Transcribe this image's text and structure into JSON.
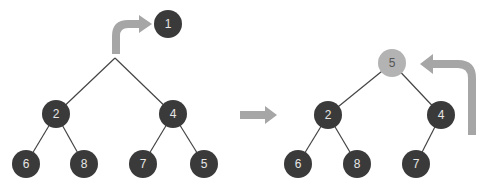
{
  "colors": {
    "node_dark": "#3a3a3a",
    "node_highlight": "#b3b3b3",
    "edge": "#444444",
    "arrow": "#a6a6a6"
  },
  "left_tree": {
    "removed_node": {
      "label": "1",
      "x": 168,
      "y": 24
    },
    "root_point": {
      "x": 115,
      "y": 58
    },
    "nodes": [
      {
        "id": "n2",
        "label": "2",
        "x": 56,
        "y": 114
      },
      {
        "id": "n4",
        "label": "4",
        "x": 173,
        "y": 114
      },
      {
        "id": "n6",
        "label": "6",
        "x": 26,
        "y": 164
      },
      {
        "id": "n8",
        "label": "8",
        "x": 84,
        "y": 164
      },
      {
        "id": "n7",
        "label": "7",
        "x": 143,
        "y": 164
      },
      {
        "id": "n5",
        "label": "5",
        "x": 204,
        "y": 164
      }
    ]
  },
  "right_tree": {
    "nodes": [
      {
        "id": "r5",
        "label": "5",
        "x": 392,
        "y": 63,
        "highlight": true
      },
      {
        "id": "r2",
        "label": "2",
        "x": 328,
        "y": 115
      },
      {
        "id": "r4",
        "label": "4",
        "x": 441,
        "y": 115
      },
      {
        "id": "r6",
        "label": "6",
        "x": 298,
        "y": 164
      },
      {
        "id": "r8",
        "label": "8",
        "x": 357,
        "y": 164
      },
      {
        "id": "r7",
        "label": "7",
        "x": 416,
        "y": 164
      }
    ]
  }
}
